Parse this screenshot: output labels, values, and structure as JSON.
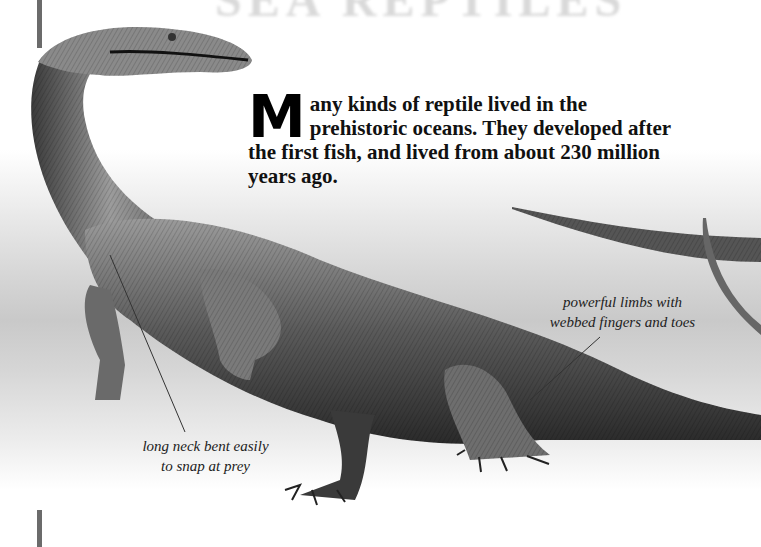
{
  "page": {
    "ghost_title": "SEA REPTILES",
    "intro": {
      "dropcap": "M",
      "text": "any kinds of reptile lived in the prehistoric oceans. They developed after the first fish, and lived from about 230 million years ago."
    },
    "callouts": [
      {
        "id": "limbs",
        "text_line1": "powerful limbs with",
        "text_line2": "webbed fingers and toes"
      },
      {
        "id": "neck",
        "text_line1": "long neck bent easily",
        "text_line2": "to snap at prey"
      }
    ],
    "illustration": {
      "subject": "long-necked prehistoric marine reptile (nothosaur-like)",
      "style": "monochrome pen-and-ink"
    },
    "colors": {
      "rule": "#6b6b6b",
      "text": "#111111",
      "band_mid": "#c9c9c9"
    }
  }
}
